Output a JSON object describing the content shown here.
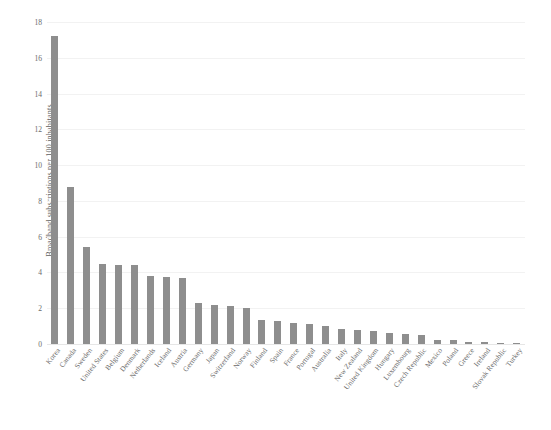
{
  "chart_data": {
    "type": "bar",
    "title": "",
    "xlabel": "",
    "ylabel": "Broadband subscriptions per 100 inhabitants",
    "ylim": [
      0,
      18
    ],
    "yticks": [
      0,
      2,
      4,
      6,
      8,
      10,
      12,
      14,
      16,
      18
    ],
    "ytick_labels": [
      "0",
      "2",
      "4",
      "6",
      "8",
      "10",
      "12",
      "14",
      "16",
      "18"
    ],
    "grid": true,
    "legend": "none",
    "bar_color": "#8e8e8e",
    "categories": [
      "Korea",
      "Canada",
      "Sweden",
      "United States",
      "Belgium",
      "Denmark",
      "Netherlands",
      "Iceland",
      "Austria",
      "Germany",
      "Japan",
      "Switzerland",
      "Norway",
      "Finland",
      "Spain",
      "France",
      "Portugal",
      "Australia",
      "Italy",
      "New Zealand",
      "United Kingdom",
      "Hungary",
      "Luxembourg",
      "Czech Republic",
      "Mexico",
      "Poland",
      "Greece",
      "Ireland",
      "Slovak Republic",
      "Turkey"
    ],
    "values": [
      17.2,
      8.8,
      5.4,
      4.5,
      4.4,
      4.4,
      3.8,
      3.75,
      3.7,
      2.3,
      2.2,
      2.1,
      2.0,
      1.35,
      1.3,
      1.2,
      1.1,
      1.0,
      0.85,
      0.8,
      0.75,
      0.6,
      0.55,
      0.5,
      0.25,
      0.2,
      0.12,
      0.1,
      0.08,
      0.05
    ]
  }
}
